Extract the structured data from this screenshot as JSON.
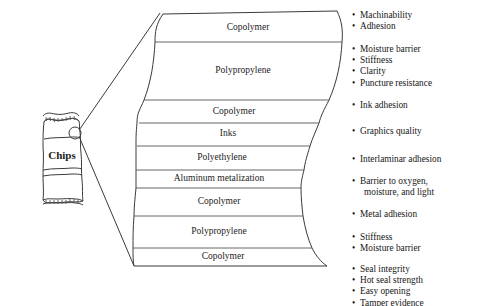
{
  "figure": {
    "title_note": "multilayer snack-chip packaging film cross-section",
    "product": {
      "label": "Chips",
      "callout_icon": "magnifier-circle-icon"
    },
    "layers": [
      {
        "name": "Copolymer",
        "y_top": 14,
        "y_bottom": 42
      },
      {
        "name": "Polypropylene",
        "y_top": 42,
        "y_bottom": 100
      },
      {
        "name": "Copolymer",
        "y_top": 100,
        "y_bottom": 123
      },
      {
        "name": "Inks",
        "y_top": 123,
        "y_bottom": 146
      },
      {
        "name": "Polyethylene",
        "y_top": 146,
        "y_bottom": 170
      },
      {
        "name": "Aluminum metalization",
        "y_top": 170,
        "y_bottom": 188
      },
      {
        "name": "Copolymer",
        "y_top": 188,
        "y_bottom": 216
      },
      {
        "name": "Polypropylene",
        "y_top": 216,
        "y_bottom": 248
      },
      {
        "name": "Copolymer",
        "y_top": 248,
        "y_bottom": 266
      }
    ],
    "property_groups": [
      {
        "top": 10,
        "items": [
          "Machinability",
          "Adhesion"
        ]
      },
      {
        "top": 44,
        "items": [
          "Moisture barrier",
          "Stiffness",
          "Clarity",
          "Puncture resistance"
        ]
      },
      {
        "top": 100,
        "items": [
          "Ink adhesion"
        ]
      },
      {
        "top": 126,
        "items": [
          "Graphics quality"
        ]
      },
      {
        "top": 154,
        "items": [
          "Interlaminar adhesion"
        ]
      },
      {
        "top": 176,
        "items": [
          "Barrier to oxygen,",
          "moisture, and light"
        ],
        "continuation_from": 1
      },
      {
        "top": 209,
        "items": [
          "Metal adhesion"
        ]
      },
      {
        "top": 232,
        "items": [
          "Stiffness",
          "Moisture barrier"
        ]
      },
      {
        "top": 264,
        "items": [
          "Seal integrity",
          "Hot seal strength",
          "Easy opening",
          "Tamper evidence"
        ]
      }
    ],
    "colors": {
      "stroke": "#3a3a3a",
      "divider": "#555555",
      "text": "#161616",
      "background": "#ffffff"
    }
  }
}
